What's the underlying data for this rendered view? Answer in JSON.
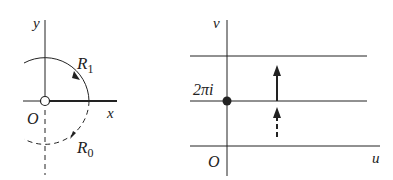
{
  "left_panel": {
    "axis_x_label": "x",
    "axis_y_label": "y",
    "origin_label": "O",
    "contour_upper_label": "R",
    "contour_upper_sub": "1",
    "contour_lower_label": "R",
    "contour_lower_sub": "0"
  },
  "right_panel": {
    "axis_u_label": "u",
    "axis_v_label": "v",
    "origin_label": "O",
    "point_label": "2πi"
  },
  "colors": {
    "stroke": "#222222",
    "background": "#ffffff"
  }
}
